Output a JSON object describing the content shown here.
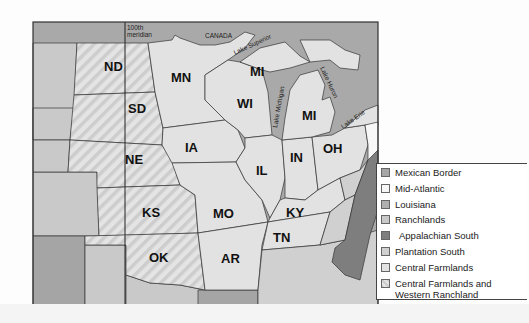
{
  "map": {
    "labels": {
      "meridian_line1": "100th",
      "meridian_line2": "meridian",
      "canada": "CANADA",
      "lake_superior": "Lake Superior",
      "lake_michigan": "Lake Michigan",
      "lake_huron": "Lake Huron",
      "lake_erie": "Lake Erie"
    },
    "states": {
      "ND": "ND",
      "SD": "SD",
      "NE": "NE",
      "KS": "KS",
      "OK": "OK",
      "MN": "MN",
      "IA": "IA",
      "MO": "MO",
      "AR": "AR",
      "WI": "WI",
      "IL": "IL",
      "MI_UP": "MI",
      "MI": "MI",
      "IN": "IN",
      "OH": "OH",
      "KY": "KY",
      "TN": "TN"
    },
    "colors": {
      "water": "#a9a9a9",
      "central_farmlands": "#e2e2e2",
      "mid_atlantic": "#f7f7f7",
      "ranchlands": "#c9c9c9",
      "mexican_border": "#a5a5a5",
      "plantation_south": "#d0d0d0",
      "appalachian_south": "#7e7e7e",
      "louisiana": "#b3b3b3",
      "hatch": "#cfcfcf"
    }
  },
  "legend": {
    "items": [
      {
        "label": "Mexican Border",
        "color": "#a5a5a5"
      },
      {
        "label": "Mid-Atlantic",
        "color": "#f7f7f7"
      },
      {
        "label": "Louisiana",
        "color": "#b0b0b0"
      },
      {
        "label": "Ranchlands",
        "color": "#c9c9c9"
      },
      {
        "label": "Appalachian South",
        "color": "#7e7e7e"
      },
      {
        "label": "Plantation South",
        "color": "#d0d0d0"
      },
      {
        "label": "Central Farmlands",
        "color": "#e2e2e2"
      },
      {
        "label": "Central Farmlands and Western Ranchland",
        "color": "#dcdcdc"
      }
    ]
  }
}
